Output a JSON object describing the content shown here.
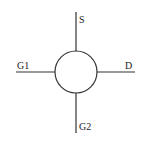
{
  "diagram": {
    "colors": {
      "line": "#333333",
      "text": "#222222",
      "background": "#ffffff"
    },
    "body": {
      "shape": "circle",
      "cx": 76,
      "cy": 72,
      "r": 21
    },
    "terminals": [
      {
        "id": "S",
        "label": "S",
        "direction": "up"
      },
      {
        "id": "G1",
        "label": "G1",
        "direction": "left"
      },
      {
        "id": "D",
        "label": "D",
        "direction": "right"
      },
      {
        "id": "G2",
        "label": "G2",
        "direction": "down"
      }
    ]
  }
}
